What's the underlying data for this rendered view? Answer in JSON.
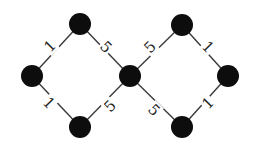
{
  "diagram": {
    "type": "weighted-graph",
    "colors": {
      "node": "#0d0d0d",
      "edge": "#3a3a3a",
      "label": "#222222",
      "background": "#ffffff"
    },
    "nodes": [
      {
        "id": "top-left",
        "x": 80,
        "y": 24
      },
      {
        "id": "left",
        "x": 32,
        "y": 76
      },
      {
        "id": "bottom-left",
        "x": 80,
        "y": 127
      },
      {
        "id": "center",
        "x": 130,
        "y": 76
      },
      {
        "id": "top-right",
        "x": 182,
        "y": 25
      },
      {
        "id": "right",
        "x": 228,
        "y": 76
      },
      {
        "id": "bottom-right",
        "x": 182,
        "y": 127
      }
    ],
    "edges": [
      {
        "from": "left",
        "to": "top-left",
        "weight": "1",
        "lx": 50,
        "ly": 46,
        "rot": -45
      },
      {
        "from": "top-left",
        "to": "center",
        "weight": "5",
        "lx": 106,
        "ly": 47,
        "rot": 45
      },
      {
        "from": "left",
        "to": "bottom-left",
        "weight": "1",
        "lx": 49,
        "ly": 103,
        "rot": 45
      },
      {
        "from": "bottom-left",
        "to": "center",
        "weight": "5",
        "lx": 110,
        "ly": 106,
        "rot": -45
      },
      {
        "from": "center",
        "to": "top-right",
        "weight": "5",
        "lx": 150,
        "ly": 47,
        "rot": -45
      },
      {
        "from": "top-right",
        "to": "right",
        "weight": "1",
        "lx": 208,
        "ly": 47,
        "rot": 45
      },
      {
        "from": "center",
        "to": "bottom-right",
        "weight": "5",
        "lx": 154,
        "ly": 110,
        "rot": 45
      },
      {
        "from": "bottom-right",
        "to": "right",
        "weight": "1",
        "lx": 208,
        "ly": 103,
        "rot": -45
      }
    ],
    "node_radius": 11
  }
}
